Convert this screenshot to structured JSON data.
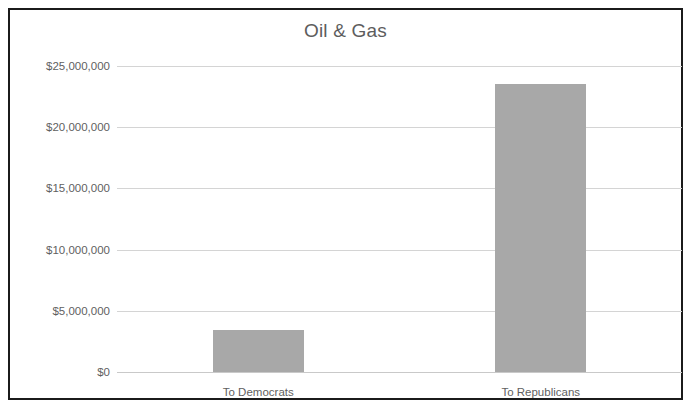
{
  "chart": {
    "title": "Oil & Gas"
  },
  "chart_data": {
    "type": "bar",
    "title": "Oil & Gas",
    "xlabel": "",
    "ylabel": "",
    "categories": [
      "To Democrats",
      "To Republicans"
    ],
    "values": [
      3450000,
      23500000
    ],
    "ylim": [
      0,
      25000000
    ],
    "ytick_values": [
      0,
      5000000,
      10000000,
      15000000,
      20000000,
      25000000
    ],
    "ytick_labels": [
      "$0",
      "$5,000,000",
      "$10,000,000",
      "$15,000,000",
      "$20,000,000",
      "$25,000,000"
    ],
    "grid": true,
    "legend": false,
    "bar_color": "#a8a8a8",
    "gridline_color": "#d4d4d4",
    "text_color": "#5f5f5f",
    "frame_color": "#1b1b1b",
    "background": "#ffffff"
  }
}
